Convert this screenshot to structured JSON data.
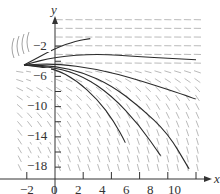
{
  "chart_data": {
    "type": "slope-field",
    "title": "",
    "xlabel": "x",
    "ylabel": "y",
    "xlim": [
      -2.5,
      10.5
    ],
    "ylim": [
      -19.5,
      2.5
    ],
    "x_ticks": [
      -2,
      0,
      2,
      4,
      6,
      8,
      10
    ],
    "x_tick_labels": [
      "−2",
      "0",
      "2",
      "4",
      "6",
      "8",
      "10"
    ],
    "y_ticks": [
      -2,
      -6,
      -10,
      -14,
      -18
    ],
    "y_tick_labels": [
      "−2",
      "−6",
      "−10",
      "−14",
      "−18"
    ],
    "y_minor_ticks": [
      -4,
      -8,
      -12,
      -16
    ],
    "grid": false,
    "legend": null,
    "field": {
      "x_range": [
        -2.5,
        10.5
      ],
      "y_range": [
        -18.5,
        1.5
      ],
      "description": "Direction field: near-horizontal segments for y > -4, steepening downward slopes for lower y and larger x"
    },
    "solution_curves": [
      {
        "points": [
          [
            -2.2,
            -4.5
          ],
          [
            0,
            -2.3
          ],
          [
            1.5,
            -1.3
          ],
          [
            2.5,
            -1.0
          ]
        ]
      },
      {
        "points": [
          [
            -2.2,
            -4.5
          ],
          [
            0,
            -3.4
          ],
          [
            3,
            -3.0
          ],
          [
            6,
            -3.4
          ],
          [
            10,
            -3.8
          ]
        ]
      },
      {
        "points": [
          [
            -2.2,
            -4.5
          ],
          [
            0,
            -4.3
          ],
          [
            3,
            -5.0
          ],
          [
            6,
            -6.5
          ],
          [
            10,
            -9.0
          ]
        ]
      },
      {
        "points": [
          [
            -2.2,
            -4.5
          ],
          [
            0,
            -4.6
          ],
          [
            2,
            -5.5
          ],
          [
            4,
            -7.2
          ],
          [
            6,
            -10.0
          ],
          [
            8,
            -13.5
          ],
          [
            9.5,
            -18.2
          ]
        ]
      },
      {
        "points": [
          [
            -2.2,
            -4.5
          ],
          [
            0,
            -4.8
          ],
          [
            2,
            -6.0
          ],
          [
            4,
            -8.5
          ],
          [
            6,
            -12.5
          ],
          [
            7.5,
            -16.5
          ]
        ]
      },
      {
        "points": [
          [
            -2.2,
            -4.5
          ],
          [
            0,
            -5.0
          ],
          [
            1.5,
            -6.5
          ],
          [
            3,
            -9.0
          ],
          [
            4.2,
            -12.0
          ],
          [
            5,
            -14.8
          ]
        ]
      }
    ]
  },
  "axes": {
    "x_name": "x",
    "y_name": "y"
  }
}
